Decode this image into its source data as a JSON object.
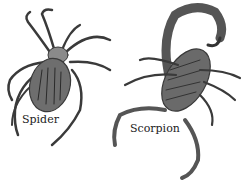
{
  "figure": {
    "labels": {
      "spider": "Spider",
      "scorpion": "Scorpion"
    },
    "colors": {
      "ink": "#333333",
      "body_dark": "#4a4a4a",
      "body_light": "#9a9a9a",
      "background": "#ffffff"
    }
  }
}
